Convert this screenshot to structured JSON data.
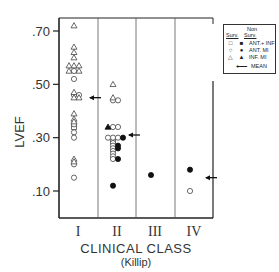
{
  "chart_data": {
    "type": "scatter",
    "title": "",
    "ylabel": "LVEF",
    "xlabel": "CLINICAL CLASS",
    "xlabel_sub": "(Killip)",
    "categories": [
      "I",
      "II",
      "III",
      "IV"
    ],
    "yticks": [
      0.1,
      0.3,
      0.5,
      0.7
    ],
    "ytick_labels": [
      ".10",
      ".30",
      ".50",
      ".70"
    ],
    "ylim": [
      0.0,
      0.75
    ],
    "grid": false,
    "legend_position": "upper right",
    "legend": {
      "header_surv": "Surv.",
      "header_non": "Non",
      "header_nonsurv": "Surv.",
      "entries": [
        {
          "open_symbol": "square",
          "filled_symbol": "square",
          "label": "ANT.+ INF"
        },
        {
          "open_symbol": "circle",
          "filled_symbol": "circle",
          "label": "ANT. MI"
        },
        {
          "open_symbol": "triangle",
          "filled_symbol": "triangle",
          "label": "INF. MI"
        },
        {
          "symbol": "arrow",
          "label": "MEAN"
        }
      ]
    },
    "series": [
      {
        "name": "Surv. ANT.+INF",
        "marker": "square",
        "filled": false,
        "points": [
          [
            "I",
            0.34
          ],
          [
            "II",
            0.29
          ]
        ]
      },
      {
        "name": "Surv. ANT. MI",
        "marker": "circle",
        "filled": false,
        "points": [
          [
            "I",
            0.55
          ],
          [
            "I",
            0.52
          ],
          [
            "I",
            0.46
          ],
          [
            "I",
            0.46
          ],
          [
            "I",
            0.35
          ],
          [
            "I",
            0.32
          ],
          [
            "I",
            0.3
          ],
          [
            "I",
            0.2
          ],
          [
            "I",
            0.15
          ],
          [
            "II",
            0.44
          ],
          [
            "II",
            0.44
          ],
          [
            "II",
            0.34
          ],
          [
            "II",
            0.34
          ],
          [
            "II",
            0.3
          ],
          [
            "II",
            0.3
          ],
          [
            "II",
            0.3
          ],
          [
            "II",
            0.28
          ],
          [
            "II",
            0.27
          ],
          [
            "II",
            0.26
          ],
          [
            "II",
            0.25
          ],
          [
            "II",
            0.24
          ],
          [
            "II",
            0.23
          ],
          [
            "II",
            0.22
          ],
          [
            "IV",
            0.1
          ]
        ]
      },
      {
        "name": "Surv. INF. MI",
        "marker": "triangle",
        "filled": false,
        "points": [
          [
            "I",
            0.72
          ],
          [
            "I",
            0.64
          ],
          [
            "I",
            0.62
          ],
          [
            "I",
            0.6
          ],
          [
            "I",
            0.57
          ],
          [
            "I",
            0.57
          ],
          [
            "I",
            0.57
          ],
          [
            "I",
            0.55
          ],
          [
            "I",
            0.55
          ],
          [
            "I",
            0.47
          ],
          [
            "I",
            0.45
          ],
          [
            "I",
            0.45
          ],
          [
            "I",
            0.39
          ],
          [
            "I",
            0.37
          ],
          [
            "I",
            0.36
          ],
          [
            "I",
            0.22
          ],
          [
            "I",
            0.21
          ],
          [
            "II",
            0.5
          ],
          [
            "II",
            0.45
          ]
        ]
      },
      {
        "name": "Non Surv. ANT. MI",
        "marker": "circle",
        "filled": true,
        "points": [
          [
            "II",
            0.3
          ],
          [
            "II",
            0.27
          ],
          [
            "II",
            0.26
          ],
          [
            "II",
            0.22
          ],
          [
            "II",
            0.12
          ],
          [
            "III",
            0.16
          ],
          [
            "IV",
            0.18
          ]
        ]
      },
      {
        "name": "Non Surv. INF. MI",
        "marker": "triangle",
        "filled": true,
        "points": [
          [
            "II",
            0.34
          ]
        ]
      },
      {
        "name": "Mean",
        "marker": "arrow",
        "points": [
          [
            "I",
            0.45
          ],
          [
            "II",
            0.31
          ],
          [
            "IV",
            0.15
          ]
        ]
      }
    ]
  }
}
